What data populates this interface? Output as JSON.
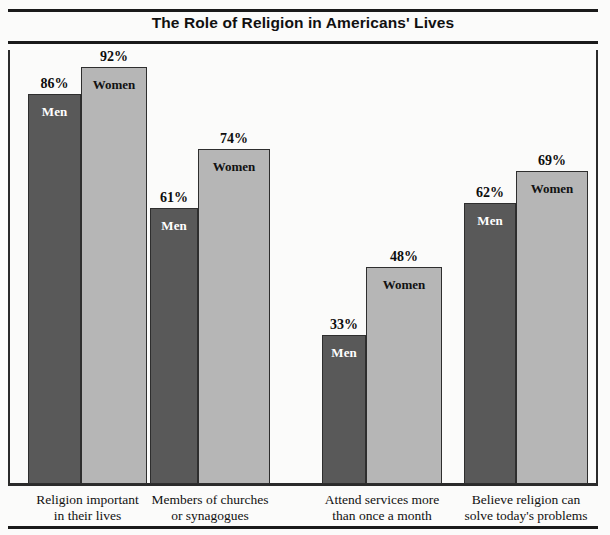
{
  "chart_data": {
    "type": "bar",
    "title": "The Role of Religion in Americans' Lives",
    "xlabel": "",
    "ylabel": "",
    "ylim": [
      0,
      100
    ],
    "grid": false,
    "legend": "in-bar",
    "value_suffix": "%",
    "categories": [
      "Religion important in their lives",
      "Members of churches or synagogues",
      "Attend services more than once a month",
      "Believe religion can solve today's problems"
    ],
    "series": [
      {
        "name": "Men",
        "values": [
          86,
          61,
          33,
          62
        ],
        "color": "#595959"
      },
      {
        "name": "Women",
        "values": [
          92,
          74,
          48,
          69
        ],
        "color": "#b6b6b6"
      }
    ],
    "groups": [
      {
        "caption_line1": "Religion important",
        "caption_line2": "in their lives",
        "bars": [
          {
            "series": "Men",
            "value": 86,
            "value_label": "86%"
          },
          {
            "series": "Women",
            "value": 92,
            "value_label": "92%"
          }
        ]
      },
      {
        "caption_line1": "Members of churches",
        "caption_line2": "or synagogues",
        "bars": [
          {
            "series": "Men",
            "value": 61,
            "value_label": "61%"
          },
          {
            "series": "Women",
            "value": 74,
            "value_label": "74%"
          }
        ]
      },
      {
        "caption_line1": "Attend services more",
        "caption_line2": "than once a month",
        "bars": [
          {
            "series": "Men",
            "value": 33,
            "value_label": "33%"
          },
          {
            "series": "Women",
            "value": 48,
            "value_label": "48%"
          }
        ]
      },
      {
        "caption_line1": "Believe religion can",
        "caption_line2": "solve today's problems",
        "bars": [
          {
            "series": "Men",
            "value": 62,
            "value_label": "62%"
          },
          {
            "series": "Women",
            "value": 69,
            "value_label": "69%"
          }
        ]
      }
    ]
  }
}
